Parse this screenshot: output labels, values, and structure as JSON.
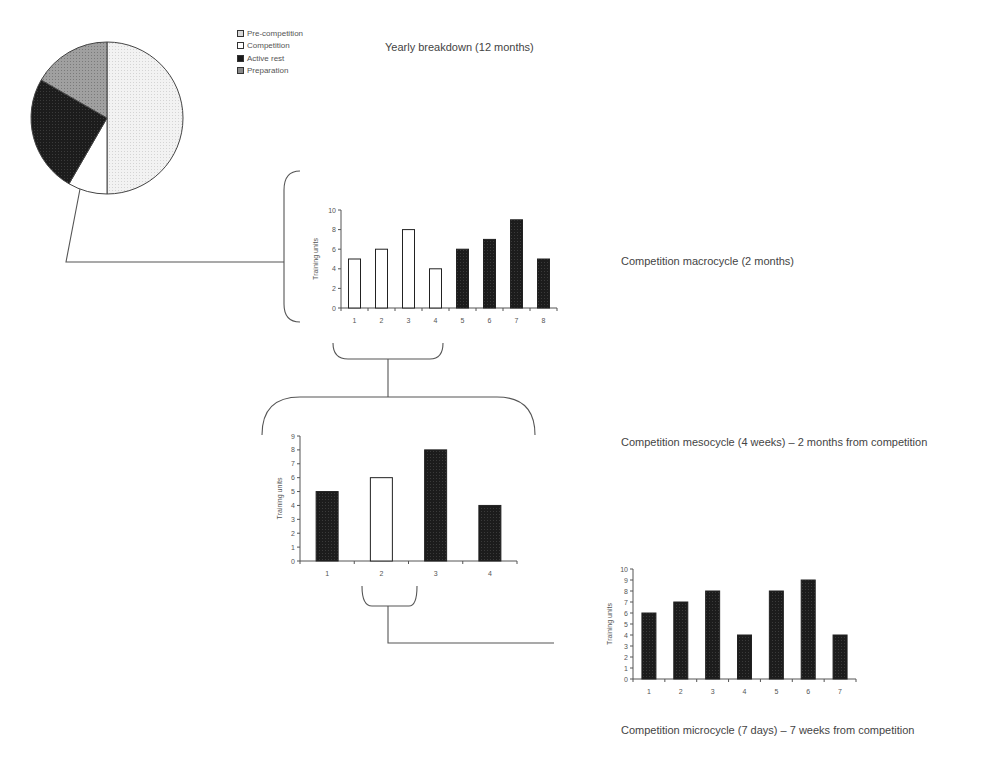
{
  "colors": {
    "line": "#444444",
    "axis": "#555555",
    "bar_dark": "#1e1e1e",
    "bar_light": "#ffffff",
    "pre_competition": "#ececec",
    "competition": "#ffffff",
    "active_rest": "#1a1a1a",
    "preparation": "#9a9a9a"
  },
  "captions": {
    "yearly": "Yearly breakdown (12 months)",
    "macrocycle": "Competition macrocycle (2 months)",
    "mesocycle": "Competition mesocycle (4 weeks)  – 2 months from competition",
    "microcycle": "Competition microcycle (7 days) – 7 weeks from competition"
  },
  "legend": [
    {
      "label": "Pre-competition",
      "color": "#ececec"
    },
    {
      "label": "Competition",
      "color": "#ffffff"
    },
    {
      "label": "Active rest",
      "color": "#1a1a1a"
    },
    {
      "label": "Preparation",
      "color": "#9a9a9a"
    }
  ],
  "chart_data": [
    {
      "type": "pie",
      "title": "Yearly breakdown (12 months)",
      "categories": [
        "Pre-competition",
        "Competition",
        "Active rest",
        "Preparation"
      ],
      "values": [
        6,
        1,
        3,
        2
      ],
      "unit": "months",
      "legend_position": "top-right"
    },
    {
      "type": "bar",
      "title": "Competition macrocycle (2 months)",
      "categories": [
        "1",
        "2",
        "3",
        "4",
        "5",
        "6",
        "7",
        "8"
      ],
      "values": [
        5,
        6,
        8,
        4,
        6,
        7,
        9,
        5
      ],
      "bar_fill": [
        "light",
        "light",
        "light",
        "light",
        "dark",
        "dark",
        "dark",
        "dark"
      ],
      "xlabel": "",
      "ylabel": "Training units",
      "ylim": [
        0,
        10
      ],
      "yticks": [
        0,
        2,
        4,
        6,
        8,
        10
      ],
      "grid": false
    },
    {
      "type": "bar",
      "title": "Competition mesocycle (4 weeks) – 2 months from competition",
      "categories": [
        "1",
        "2",
        "3",
        "4"
      ],
      "values": [
        5,
        6,
        8,
        4
      ],
      "bar_fill": [
        "dark",
        "light",
        "dark",
        "dark"
      ],
      "xlabel": "",
      "ylabel": "Training units",
      "ylim": [
        0,
        9
      ],
      "yticks": [
        0,
        1,
        2,
        3,
        4,
        5,
        6,
        7,
        8,
        9
      ],
      "grid": false
    },
    {
      "type": "bar",
      "title": "Competition microcycle (7 days) – 7 weeks from competition",
      "categories": [
        "1",
        "2",
        "3",
        "4",
        "5",
        "6",
        "7"
      ],
      "values": [
        6,
        7,
        8,
        4,
        8,
        9,
        4
      ],
      "bar_fill": [
        "dark",
        "dark",
        "dark",
        "dark",
        "dark",
        "dark",
        "dark"
      ],
      "xlabel": "",
      "ylabel": "Training units",
      "ylim": [
        0,
        10
      ],
      "yticks": [
        0,
        1,
        2,
        3,
        4,
        5,
        6,
        7,
        8,
        9,
        10
      ],
      "grid": false
    }
  ]
}
